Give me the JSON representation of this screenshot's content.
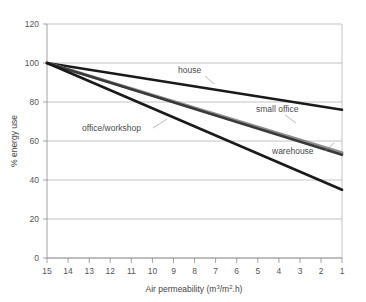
{
  "chart_data": {
    "type": "line",
    "title": "",
    "subtitle": "",
    "xlabel": "Air permeability (m³/m².h)",
    "xlabel_parts": {
      "main": "Air permeability (m",
      "sup1": "3",
      "mid": "/m",
      "sup2": "2",
      "tail": ".h)"
    },
    "ylabel": "% energy use",
    "xlim": [
      15,
      1
    ],
    "ylim": [
      0,
      120
    ],
    "x_reversed": true,
    "grid": "horizontal",
    "legend": "inline-annotations",
    "xticks": [
      15,
      14,
      13,
      12,
      11,
      10,
      9,
      8,
      7,
      6,
      5,
      4,
      3,
      2,
      1
    ],
    "yticks": [
      0,
      20,
      40,
      60,
      80,
      100,
      120
    ],
    "x": [
      15,
      1
    ],
    "series": [
      {
        "name": "house",
        "color": "#1a1a1a",
        "width": 2.6,
        "values": [
          100,
          76
        ],
        "label": "house",
        "label_x": 178,
        "label_y": 73,
        "leader": "M 205 76 L 214 84"
      },
      {
        "name": "small office",
        "color": "#8d8d8d",
        "width": 3.2,
        "values": [
          100,
          54
        ],
        "label": "small office",
        "label_x": 256,
        "label_y": 112,
        "leader": "M 285 115 L 296 123"
      },
      {
        "name": "warehouse",
        "color": "#3a3a3a",
        "width": 2.6,
        "values": [
          100,
          53
        ],
        "label": "warehouse",
        "label_x": 272,
        "label_y": 154,
        "leader": "M 325 151 L 334 143"
      },
      {
        "name": "office/workshop",
        "color": "#1a1a1a",
        "width": 2.6,
        "values": [
          100,
          35
        ],
        "label": "office/workshop",
        "label_x": 82,
        "label_y": 131,
        "leader": "M 153 128 L 167 119"
      }
    ]
  },
  "axes": {
    "y_tick_labels": [
      "0",
      "20",
      "40",
      "60",
      "80",
      "100",
      "120"
    ],
    "x_tick_labels": [
      "15",
      "14",
      "13",
      "12",
      "11",
      "10",
      "9",
      "8",
      "7",
      "6",
      "5",
      "4",
      "3",
      "2",
      "1"
    ]
  }
}
